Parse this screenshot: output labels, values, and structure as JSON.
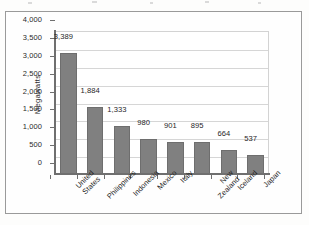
{
  "chart_data": {
    "type": "bar",
    "title": "",
    "xlabel": "",
    "ylabel": "Megawatts",
    "ylim": [
      0,
      4000
    ],
    "ytick_step": 500,
    "grid": true,
    "legend": false,
    "orientation": "vertical",
    "bar_color": "#808080",
    "categories": [
      "United States",
      "Philippines",
      "Indonesia",
      "Mexico",
      "Italy",
      "New Zealand",
      "Iceland",
      "Japan"
    ],
    "category_lines": [
      [
        "United",
        "States"
      ],
      [
        "Philippines"
      ],
      [
        "Indonesia"
      ],
      [
        "Mexico"
      ],
      [
        "Italy"
      ],
      [
        "New",
        "Zealand"
      ],
      [
        "Iceland"
      ],
      [
        "Japan"
      ]
    ],
    "values": [
      3389,
      1884,
      1333,
      980,
      901,
      895,
      664,
      537
    ],
    "data_labels": [
      "3,389",
      "1,884",
      "1,333",
      "980",
      "901",
      "895",
      "664",
      "537"
    ],
    "ytick_labels": [
      "4,000",
      "3,500",
      "3,000",
      "2,500",
      "2,000",
      "1,500",
      "1,000",
      "500",
      "0"
    ],
    "ytick_values": [
      4000,
      3500,
      3000,
      2500,
      2000,
      1500,
      1000,
      500,
      0
    ]
  },
  "colors": {
    "bar": "#808080",
    "bar_edge": "#6e6e6e",
    "axis": "#6f6f6f",
    "grid": "#d6d6d6",
    "frame": "#9a9a9a",
    "text": "#1f1f1f",
    "background": "#fefefe"
  }
}
